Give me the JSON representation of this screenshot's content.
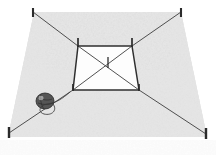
{
  "figure": {
    "medium": "scanned pen-and-ink stipple line drawing",
    "background_color": "#ffffff",
    "ink_color": "#3a3a3a",
    "stipple_color": "#b8b8b8",
    "width": 216,
    "height": 155,
    "bottom_artifact_text": ""
  },
  "ground": {
    "name": "stippled-ground-plot",
    "shape": "trapezoid-perspective",
    "fill_color": "#d8d8d8",
    "corners": {
      "top_left": [
        34,
        12
      ],
      "top_right": [
        181,
        12
      ],
      "bottom_right": [
        207,
        137
      ],
      "bottom_left": [
        8,
        137
      ]
    }
  },
  "outer_stakes": [
    {
      "label": "corner-stake-top-left",
      "x": 33,
      "y": 12
    },
    {
      "label": "corner-stake-top-right",
      "x": 181,
      "y": 12
    },
    {
      "label": "corner-stake-bottom-right",
      "x": 206,
      "y": 134
    },
    {
      "label": "corner-stake-bottom-left",
      "x": 9,
      "y": 133
    }
  ],
  "inner_square": {
    "name": "string-marked-square",
    "corners": {
      "top_left": [
        78,
        46
      ],
      "top_right": [
        132,
        46
      ],
      "bottom_right": [
        139,
        90
      ],
      "bottom_left": [
        73,
        90
      ]
    },
    "stakes": [
      {
        "label": "inner-stake-top-left",
        "x": 78,
        "y": 46
      },
      {
        "label": "inner-stake-top-right",
        "x": 132,
        "y": 46
      },
      {
        "label": "inner-stake-bottom-right",
        "x": 139,
        "y": 90
      },
      {
        "label": "inner-stake-bottom-left",
        "x": 73,
        "y": 90
      }
    ],
    "diagonals": [
      {
        "label": "diagonal-tl-br",
        "from": [
          78,
          46
        ],
        "to": [
          139,
          90
        ]
      },
      {
        "label": "diagonal-tr-bl",
        "from": [
          132,
          46
        ],
        "to": [
          73,
          90
        ]
      }
    ],
    "center_peg": {
      "label": "center-peg",
      "x": 108,
      "y": 66,
      "height": 9
    }
  },
  "guide_lines": [
    {
      "label": "guide-line-tl",
      "from": [
        78,
        46
      ],
      "to": [
        33,
        12
      ]
    },
    {
      "label": "guide-line-tr",
      "from": [
        132,
        46
      ],
      "to": [
        181,
        12
      ]
    },
    {
      "label": "guide-line-br",
      "from": [
        139,
        90
      ],
      "to": [
        206,
        134
      ]
    },
    {
      "label": "guide-line-bl",
      "from": [
        73,
        90
      ],
      "to": [
        9,
        133
      ]
    }
  ],
  "twine": {
    "name": "ball-of-twine",
    "ball_center": [
      45,
      101
    ],
    "ball_radius_x": 9,
    "ball_radius_y": 8,
    "ball_color": "#555555",
    "string_path": "M 53 104 C 58 110 52 116 44 114 C 37 112 40 105 47 104 C 56 103 62 99 70 92"
  }
}
